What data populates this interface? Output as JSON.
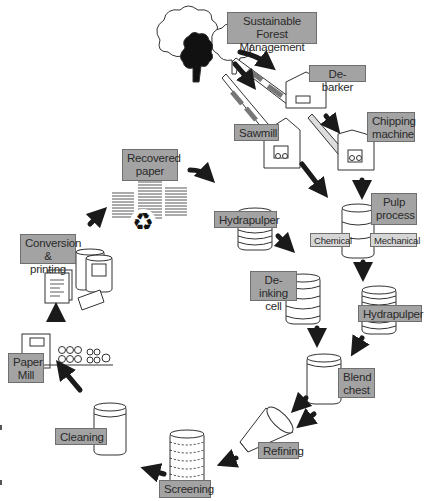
{
  "diagram": {
    "nodes": {
      "forest": {
        "line1": "Sustainable Forest",
        "line2": "Management"
      },
      "debarker": {
        "line1": "De-barker"
      },
      "sawmill": {
        "line1": "Sawmill"
      },
      "chipping": {
        "line1": "Chipping",
        "line2": "machine"
      },
      "pulp": {
        "line1": "Pulp",
        "line2": "process"
      },
      "chemical": {
        "line1": "Chemical"
      },
      "mechanical": {
        "line1": "Mechanical"
      },
      "recovered": {
        "line1": "Recovered",
        "line2": "paper"
      },
      "hydrapulper1": {
        "line1": "Hydrapulper"
      },
      "deinking": {
        "line1": "De-inking",
        "line2": "cell"
      },
      "hydrapulper2": {
        "line1": "Hydrapulper"
      },
      "blend": {
        "line1": "Blend",
        "line2": "chest"
      },
      "refining": {
        "line1": "Refining"
      },
      "screening": {
        "line1": "Screening"
      },
      "cleaning": {
        "line1": "Cleaning"
      },
      "papermill": {
        "line1": "Paper",
        "line2": "Mill"
      },
      "conversion": {
        "line1": "Conversion",
        "line2": "& printing"
      }
    },
    "edges": [
      [
        "forest",
        "debarker"
      ],
      [
        "forest",
        "sawmill"
      ],
      [
        "debarker",
        "chipping"
      ],
      [
        "sawmill",
        "pulp"
      ],
      [
        "chipping",
        "pulp"
      ],
      [
        "recovered",
        "hydrapulper1"
      ],
      [
        "hydrapulper1",
        "deinking"
      ],
      [
        "pulp",
        "hydrapulper2"
      ],
      [
        "deinking",
        "blend"
      ],
      [
        "hydrapulper2",
        "blend"
      ],
      [
        "blend",
        "refining"
      ],
      [
        "refining",
        "screening"
      ],
      [
        "screening",
        "cleaning"
      ],
      [
        "cleaning",
        "papermill"
      ],
      [
        "papermill",
        "conversion"
      ],
      [
        "conversion",
        "recovered"
      ]
    ],
    "colors": {
      "label_bg": "#a3a3a3",
      "label_light_bg": "#d6d6d6",
      "arrow": "#1a1a1a",
      "outline": "#333333"
    }
  }
}
